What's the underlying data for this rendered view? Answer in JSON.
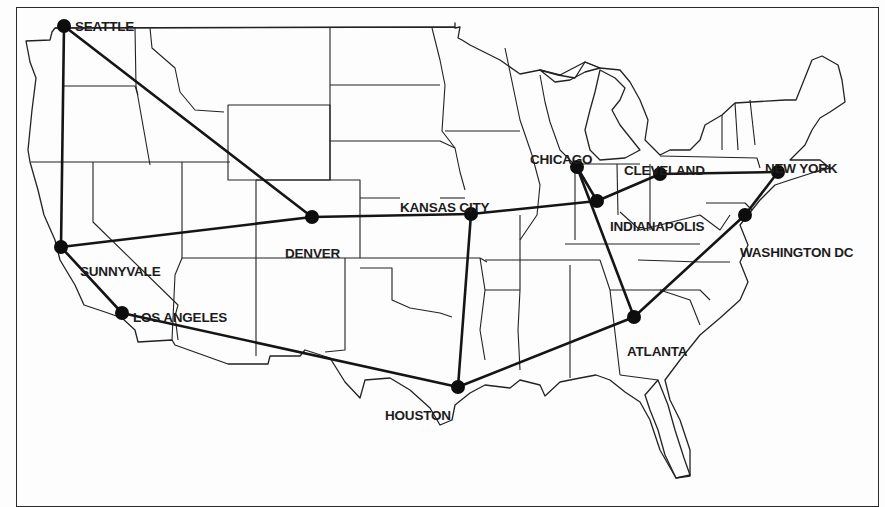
{
  "map": {
    "title": "US network backbone map",
    "colors": {
      "background": "#fdfdfd",
      "line": "#151515",
      "node": "#0d0d0d",
      "border": "#222222"
    },
    "cities": [
      {
        "id": "seattle",
        "name": "SEATTLE",
        "x": 64,
        "y": 26,
        "label_x": 75,
        "label_y": 18
      },
      {
        "id": "sunnyvale",
        "name": "SUNNYVALE",
        "x": 61,
        "y": 247,
        "label_x": 80,
        "label_y": 263
      },
      {
        "id": "los-angeles",
        "name": "LOS ANGELES",
        "x": 122,
        "y": 313,
        "label_x": 133,
        "label_y": 309
      },
      {
        "id": "denver",
        "name": "DENVER",
        "x": 312,
        "y": 217,
        "label_x": 285,
        "label_y": 245
      },
      {
        "id": "kansas-city",
        "name": "KANSAS CITY",
        "x": 471,
        "y": 214,
        "label_x": 400,
        "label_y": 199
      },
      {
        "id": "houston",
        "name": "HOUSTON",
        "x": 458,
        "y": 387,
        "label_x": 385,
        "label_y": 407
      },
      {
        "id": "chicago",
        "name": "CHICAGO",
        "x": 577,
        "y": 167,
        "label_x": 530,
        "label_y": 151
      },
      {
        "id": "indianapolis",
        "name": "INDIANAPOLIS",
        "x": 597,
        "y": 201,
        "label_x": 610,
        "label_y": 218
      },
      {
        "id": "cleveland",
        "name": "CLEVELAND",
        "x": 660,
        "y": 174,
        "label_x": 624,
        "label_y": 162
      },
      {
        "id": "new-york",
        "name": "NEW YORK",
        "x": 778,
        "y": 172,
        "label_x": 765,
        "label_y": 160
      },
      {
        "id": "washington-dc",
        "name": "WASHINGTON DC",
        "x": 745,
        "y": 215,
        "label_x": 740,
        "label_y": 244
      },
      {
        "id": "atlanta",
        "name": "ATLANTA",
        "x": 634,
        "y": 317,
        "label_x": 627,
        "label_y": 343
      }
    ],
    "links": [
      {
        "from": "seattle",
        "to": "sunnyvale"
      },
      {
        "from": "seattle",
        "to": "denver"
      },
      {
        "from": "sunnyvale",
        "to": "denver"
      },
      {
        "from": "sunnyvale",
        "to": "los-angeles"
      },
      {
        "from": "los-angeles",
        "to": "houston"
      },
      {
        "from": "denver",
        "to": "kansas-city"
      },
      {
        "from": "kansas-city",
        "to": "houston"
      },
      {
        "from": "kansas-city",
        "to": "indianapolis"
      },
      {
        "from": "houston",
        "to": "atlanta"
      },
      {
        "from": "chicago",
        "to": "indianapolis"
      },
      {
        "from": "chicago",
        "to": "atlanta"
      },
      {
        "from": "indianapolis",
        "to": "cleveland"
      },
      {
        "from": "cleveland",
        "to": "new-york"
      },
      {
        "from": "new-york",
        "to": "washington-dc"
      },
      {
        "from": "washington-dc",
        "to": "atlanta"
      }
    ]
  }
}
